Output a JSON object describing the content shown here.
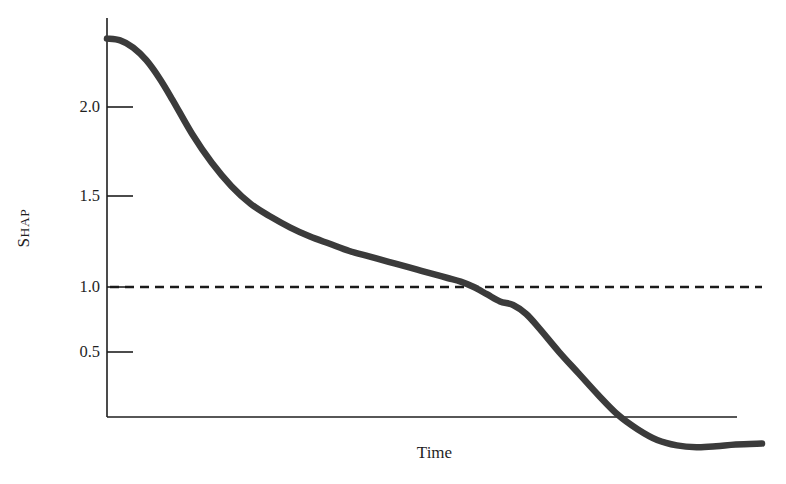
{
  "figure": {
    "width": 786,
    "height": 484,
    "background": "#ffffff"
  },
  "axis_labels": {
    "y_full": "SHAP",
    "y_cap_first": "S",
    "y_cap_rest": "HAP",
    "x": "Time"
  },
  "style": {
    "curve_color": "#3b3b3b",
    "axis_color": "#1f1f1f",
    "dash_color": "#1a1a1a",
    "text_color": "#1f1f1f",
    "curve_width": 6.5,
    "axis_width": 1.6,
    "dash_width": 2.6,
    "dash_pattern": "9 6"
  },
  "geometry": {
    "x_axis_y_px": 417,
    "y_axis_x_px": 107,
    "y_axis_top_px": 18,
    "x_axis_right_px": 737,
    "plot_right_px": 762,
    "value_1_0_y_px": 287,
    "px_per_half_unit": 90
  },
  "chart_data": {
    "type": "line",
    "title": "",
    "xlabel": "Time",
    "ylabel": "SHAP",
    "xlim": [
      0,
      100
    ],
    "ylim": [
      0.0,
      2.5
    ],
    "grid": false,
    "legend": null,
    "yticks": [
      2.0,
      1.5,
      1.0,
      0.5
    ],
    "ytick_labels": [
      "2.0",
      "1.5",
      "1.0",
      "0.5"
    ],
    "xticks": [],
    "xtick_labels": [],
    "annotations": [
      {
        "kind": "horizontal-reference-line",
        "y": 1.0,
        "style": "dashed",
        "label": ""
      }
    ],
    "series": [
      {
        "name": "SHAP",
        "style": "solid",
        "color": "#3b3b3b",
        "x": [
          0,
          2,
          4,
          6,
          8,
          10,
          13,
          16,
          19,
          22,
          25,
          28,
          31,
          34,
          37,
          40,
          43,
          46,
          48,
          50,
          52,
          54,
          56,
          58,
          60,
          62,
          64,
          66,
          69,
          72,
          75,
          78,
          81,
          84,
          87,
          90,
          93,
          96,
          100
        ],
        "y": [
          2.38,
          2.37,
          2.33,
          2.26,
          2.16,
          2.04,
          1.85,
          1.69,
          1.56,
          1.46,
          1.39,
          1.33,
          1.28,
          1.24,
          1.2,
          1.17,
          1.14,
          1.11,
          1.09,
          1.07,
          1.05,
          1.03,
          1.0,
          0.96,
          0.92,
          0.9,
          0.85,
          0.77,
          0.64,
          0.52,
          0.4,
          0.29,
          0.21,
          0.15,
          0.12,
          0.11,
          0.115,
          0.125,
          0.13
        ]
      }
    ]
  }
}
